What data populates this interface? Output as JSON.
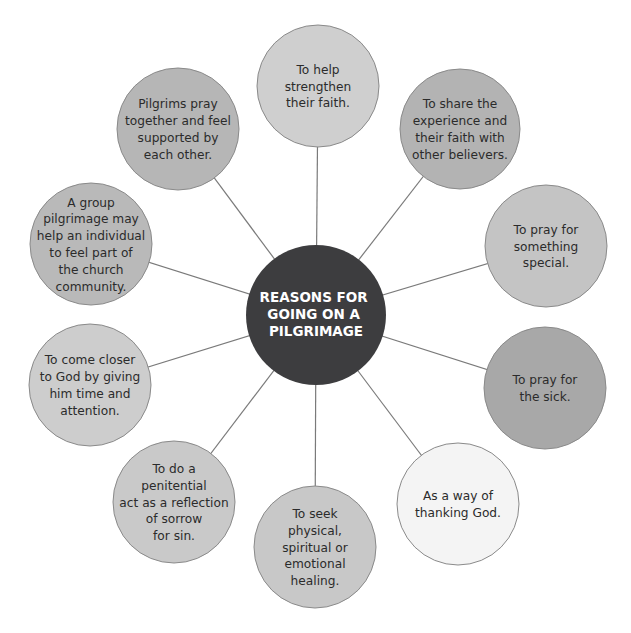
{
  "hub": {
    "title_lines": [
      "REASONS FOR",
      "GOING ON A",
      "PILGRIMAGE"
    ],
    "color": "#3d3d3f"
  },
  "nodes": [
    {
      "id": "strengthen-faith",
      "lines": [
        "To help",
        "strengthen",
        "their faith."
      ],
      "color": "#cfcfcf"
    },
    {
      "id": "share-experience",
      "lines": [
        "To share the",
        "experience and",
        "their faith with",
        "other believers."
      ],
      "color": "#b3b3b3"
    },
    {
      "id": "pray-something-special",
      "lines": [
        "To pray for",
        "something",
        "special."
      ],
      "color": "#c4c4c4"
    },
    {
      "id": "pray-for-sick",
      "lines": [
        "To pray for",
        "the sick."
      ],
      "color": "#a8a8a8"
    },
    {
      "id": "thanking-god",
      "lines": [
        "As a way of",
        "thanking God."
      ],
      "color": "#f4f4f4"
    },
    {
      "id": "seek-healing",
      "lines": [
        "To seek",
        "physical,",
        "spiritual or",
        "emotional",
        "healing."
      ],
      "color": "#c8c8c8"
    },
    {
      "id": "penitential-act",
      "lines": [
        "To do a",
        "penitential",
        "act as a reflection",
        "of sorrow",
        "for sin."
      ],
      "color": "#c9c9c9"
    },
    {
      "id": "come-closer-to-god",
      "lines": [
        "To come closer",
        "to God by giving",
        "him time and",
        "attention."
      ],
      "color": "#cdcdcd"
    },
    {
      "id": "group-pilgrimage",
      "lines": [
        "A group",
        "pilgrimage may",
        "help an individual",
        "to feel part of",
        "the church",
        "community."
      ],
      "color": "#b9b9b9"
    },
    {
      "id": "pray-together",
      "lines": [
        "Pilgrims pray",
        "together and feel",
        "supported by",
        "each other."
      ],
      "color": "#b6b6b6"
    }
  ],
  "colors": {
    "connector": "#7a7a7a",
    "node_border": "#8a8a8a",
    "text": "#2b2b2b"
  }
}
